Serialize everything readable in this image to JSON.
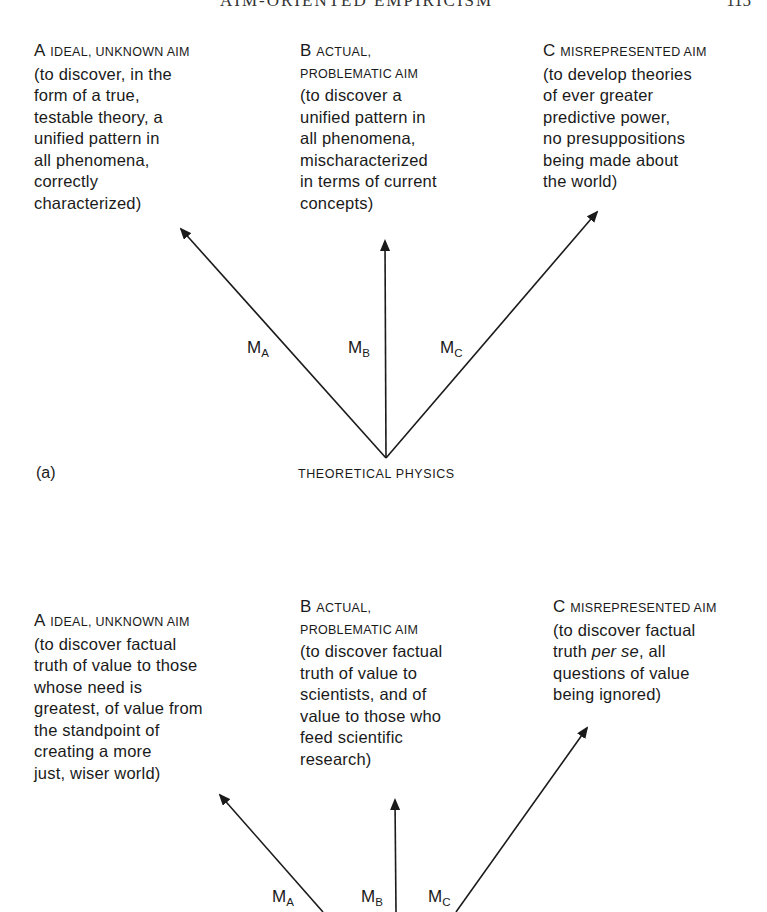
{
  "page": {
    "running_head": "AIM-ORIENTED EMPIRICISM",
    "page_number": "115"
  },
  "diagram_a": {
    "panel_label": "(a)",
    "base_label": "THEORETICAL PHYSICS",
    "aims": [
      {
        "letter": "A",
        "title": "ideal, unknown aim",
        "description": "(to discover, in the\nform of a true,\ntestable theory, a\nunified pattern in\nall phenomena,\ncorrectly\ncharacterized)"
      },
      {
        "letter": "B",
        "title_line1": "actual,",
        "title_line2": "problematic aim",
        "description": "(to discover a\nunified pattern in\nall phenomena,\nmischaracterized\nin terms of current\nconcepts)"
      },
      {
        "letter": "C",
        "title": "misrepresented aim",
        "description": "(to develop theories\nof ever greater\npredictive power,\nno presuppositions\nbeing made about\nthe world)"
      }
    ],
    "arrows": [
      {
        "label": "M",
        "sub": "A"
      },
      {
        "label": "M",
        "sub": "B"
      },
      {
        "label": "M",
        "sub": "C"
      }
    ]
  },
  "diagram_b": {
    "aims": [
      {
        "letter": "A",
        "title": "ideal, unknown aim",
        "description": "(to discover factual\ntruth of value to those\nwhose need is\ngreatest, of value from\nthe standpoint of\ncreating a more\njust, wiser world)"
      },
      {
        "letter": "B",
        "title_line1": "actual,",
        "title_line2": "problematic aim",
        "description": "(to discover factual\ntruth of value to\nscientists, and of\nvalue to those who\nfeed scientific\nresearch)"
      },
      {
        "letter": "C",
        "title": "misrepresented aim",
        "description_pre": "(to discover factual\ntruth ",
        "description_em": "per se",
        "description_post": ", all\nquestions of value\nbeing ignored)"
      }
    ],
    "arrows": [
      {
        "label": "M",
        "sub": "A"
      },
      {
        "label": "M",
        "sub": "B"
      },
      {
        "label": "M",
        "sub": "C"
      }
    ]
  }
}
